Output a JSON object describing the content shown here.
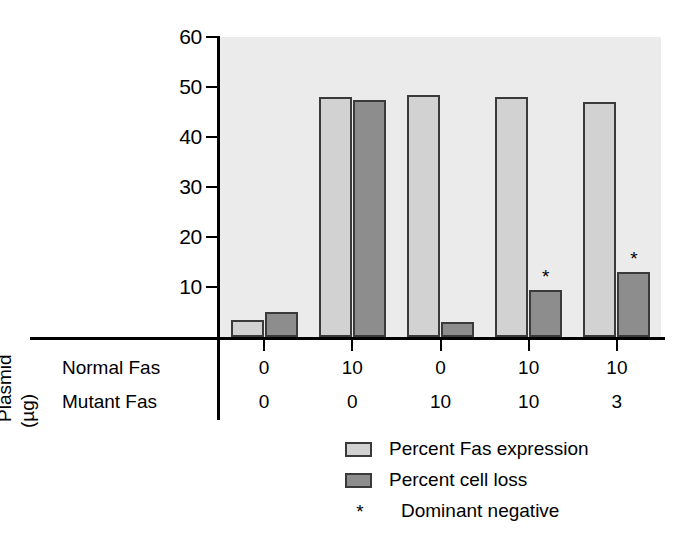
{
  "chart_data": {
    "type": "bar",
    "title": "",
    "xlabel": "",
    "ylabel": "",
    "ylim": [
      0,
      60
    ],
    "yticks": [
      10,
      20,
      30,
      40,
      50,
      60
    ],
    "grid": false,
    "legend_position": "bottom",
    "categories": [
      "1",
      "2",
      "3",
      "4",
      "5"
    ],
    "series": [
      {
        "name": "Percent Fas expression",
        "color": "#d2d2d2",
        "values": [
          3.5,
          48,
          48.5,
          48,
          47
        ]
      },
      {
        "name": "Percent cell loss",
        "color": "#8d8d8d",
        "values": [
          5,
          47.5,
          3,
          9.5,
          13
        ]
      }
    ],
    "annotations": [
      {
        "series": "Percent cell loss",
        "category_index": 3,
        "symbol": "*",
        "meaning": "Dominant negative"
      },
      {
        "series": "Percent cell loss",
        "category_index": 4,
        "symbol": "*",
        "meaning": "Dominant negative"
      }
    ],
    "group_table": {
      "axis_title_line1": "Plasmid",
      "axis_title_line2": "(µg)",
      "rows": [
        {
          "label": "Normal Fas",
          "values": [
            "0",
            "10",
            "0",
            "10",
            "10"
          ]
        },
        {
          "label": "Mutant Fas",
          "values": [
            "0",
            "0",
            "10",
            "10",
            "3"
          ]
        }
      ]
    }
  },
  "axis": {
    "y_tick_labels": [
      "60",
      "50",
      "40",
      "30",
      "20",
      "10"
    ]
  },
  "legend": {
    "items": [
      {
        "label": "Percent Fas expression",
        "swatch": "light"
      },
      {
        "label": "Percent cell loss",
        "swatch": "dark"
      },
      {
        "label": "Dominant negative",
        "symbol": "*"
      }
    ]
  },
  "symbols": {
    "asterisk": "*"
  }
}
